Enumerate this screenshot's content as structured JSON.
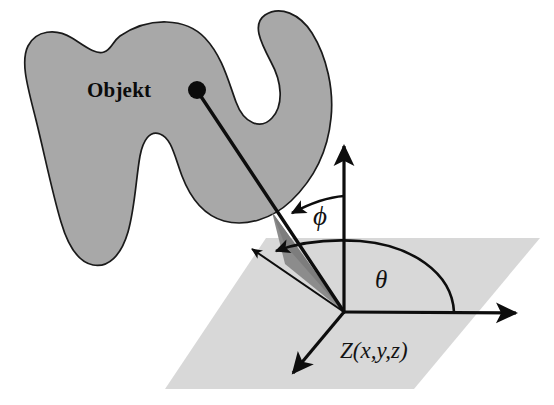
{
  "figure": {
    "background_color": "#ffffff"
  },
  "object": {
    "label": "Objekt",
    "fill_color": "#a8a8a8",
    "stroke_color": "#1a1a1a",
    "point_marker": "object-point-dot"
  },
  "ground_plane": {
    "fill_color": "#d8d8d8",
    "name": "reference-plane"
  },
  "elevation_wedge": {
    "fill_color": "#8c8c8c",
    "name": "elevation-triangle"
  },
  "axes": {
    "vertical_axis_name": "z-axis-arrow",
    "horizontal_axis_name": "x-axis-arrow",
    "depth_axis_name": "y-axis-arrow",
    "origin_label": "Z(x,y,z)",
    "stroke_color": "#0d0d0d"
  },
  "angles": {
    "azimuth": {
      "symbol": "θ",
      "name": "theta"
    },
    "elevation": {
      "symbol": "ϕ",
      "name": "phi"
    }
  },
  "connector": {
    "name": "object-to-origin-ray",
    "stroke_color": "#0d0d0d"
  }
}
